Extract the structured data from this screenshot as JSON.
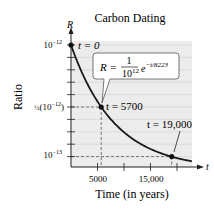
{
  "chart_data": {
    "type": "line",
    "title": "Carbon Dating",
    "xlabel": "Time (in years)",
    "ylabel": "Ratio",
    "x_axis_var": "t",
    "y_axis_var": "R",
    "formula": "R = (1/10^12) e^(-t/8223)",
    "formula_parts": {
      "lhs": "R =",
      "numerator": "1",
      "denominator": "10",
      "denominator_exp": "12",
      "base": "e",
      "exponent": "−t/8223"
    },
    "x_ticks": [
      5000,
      10000,
      15000,
      20000
    ],
    "x_tick_labels": [
      "5000",
      "",
      "15,000",
      ""
    ],
    "y_tick_labels": [
      {
        "value": 1e-12,
        "base": "10",
        "exp": "−12"
      },
      {
        "value": 5e-13,
        "prefix": "½",
        "base": "(10",
        "exp": "−12",
        "suffix": ")"
      },
      {
        "value": 1e-13,
        "base": "10",
        "exp": "−13"
      }
    ],
    "xlim": [
      0,
      22000
    ],
    "ylim": [
      0,
      1e-12
    ],
    "grid": true,
    "series": [
      {
        "name": "R(t)",
        "x": [
          0,
          2000,
          4000,
          5700,
          8000,
          10000,
          12000,
          15000,
          19000,
          21500
        ],
        "values": [
          1e-12,
          7.84e-13,
          6.15e-13,
          5e-13,
          3.78e-13,
          2.96e-13,
          2.32e-13,
          1.61e-13,
          9.9e-14,
          7.3e-14
        ]
      }
    ],
    "annotations": [
      {
        "label": "t = 0",
        "t": 0,
        "R": 1e-12
      },
      {
        "label": "t = 5700",
        "t": 5700,
        "R": 5e-13
      },
      {
        "label": "t = 19,000",
        "t": 19000,
        "R": 1e-13
      }
    ]
  },
  "colors": {
    "plot_bg": "#ececec",
    "grid": "#d0d0d0",
    "curve": "#1a1a1a",
    "dash": "#555555",
    "text": "#231f20"
  }
}
